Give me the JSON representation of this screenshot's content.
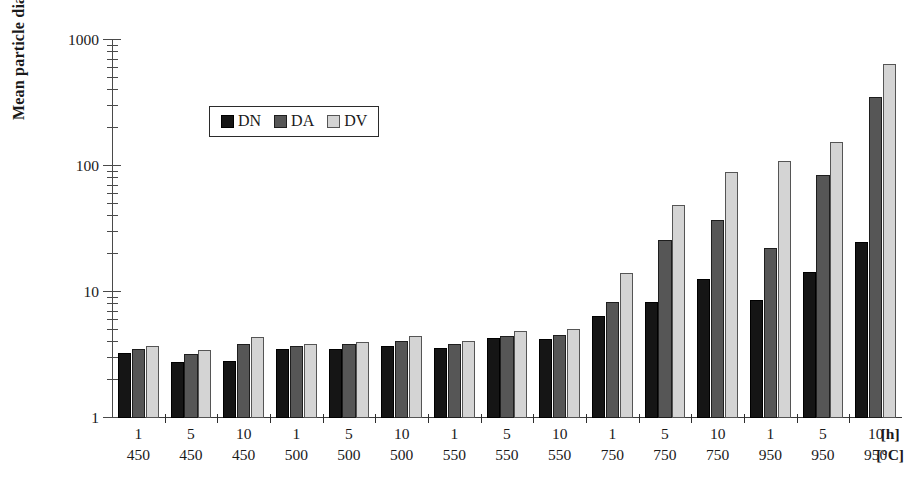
{
  "chart_data": {
    "type": "bar",
    "title": "",
    "xlabel": "",
    "ylabel": "Mean particle diameter [nm]",
    "yscale": "log",
    "ylim": [
      1,
      1000
    ],
    "ytick_labels": [
      "1",
      "10",
      "100",
      "1000"
    ],
    "grid": false,
    "legend_position": "upper-left-inside",
    "x_unit_top": "[h]",
    "x_unit_bottom": "[°C]",
    "x_row_labels": {
      "hours": [
        "1",
        "5",
        "10",
        "1",
        "5",
        "10",
        "1",
        "5",
        "10",
        "1",
        "5",
        "10",
        "1",
        "5",
        "10"
      ],
      "temperature": [
        "450",
        "450",
        "450",
        "500",
        "500",
        "500",
        "550",
        "550",
        "550",
        "750",
        "750",
        "750",
        "950",
        "950",
        "950"
      ]
    },
    "categories": [
      "1 / 450",
      "5 / 450",
      "10 / 450",
      "1 / 500",
      "5 / 500",
      "10 / 500",
      "1 / 550",
      "5 / 550",
      "10 / 550",
      "1 / 750",
      "5 / 750",
      "10 / 750",
      "1 / 950",
      "5 / 950",
      "10 / 950"
    ],
    "series": [
      {
        "name": "DN",
        "color": "#151515",
        "values": [
          3.3,
          2.8,
          2.85,
          3.5,
          3.55,
          3.7,
          3.6,
          4.3,
          4.2,
          6.5,
          8.4,
          12.8,
          8.6,
          14.5,
          25.0
        ]
      },
      {
        "name": "DA",
        "color": "#565656",
        "values": [
          3.5,
          3.2,
          3.85,
          3.75,
          3.85,
          4.1,
          3.9,
          4.5,
          4.6,
          8.4,
          26.0,
          37.0,
          22.5,
          85.0,
          350.0
        ]
      },
      {
        "name": "DV",
        "color": "#d4d4d4",
        "values": [
          3.7,
          3.45,
          4.4,
          3.9,
          4.0,
          4.45,
          4.1,
          4.9,
          5.1,
          14.2,
          49.0,
          90.0,
          110.0,
          155.0,
          650.0
        ]
      }
    ]
  },
  "legend": {
    "entries": [
      {
        "label": "DN",
        "swatch": "black-square-icon"
      },
      {
        "label": "DA",
        "swatch": "gray-square-icon"
      },
      {
        "label": "DV",
        "swatch": "light-gray-square-icon"
      }
    ]
  },
  "axis": {
    "y_title": "Mean particle diameter [nm]"
  }
}
